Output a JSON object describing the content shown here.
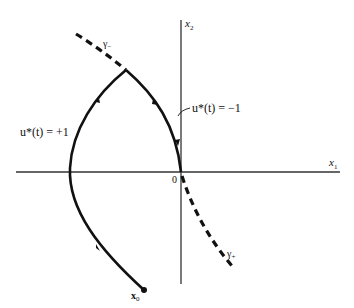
{
  "figure": {
    "type": "phase-plane trajectory diagram",
    "axes": {
      "x_label": "x",
      "x_sub": "1",
      "y_label": "x",
      "y_sub": "2",
      "origin_label": "0"
    },
    "curves": {
      "gamma_minus": {
        "label": "γ",
        "sub": "−",
        "style": "dashed"
      },
      "gamma_plus": {
        "label": "γ",
        "sub": "+",
        "style": "dashed"
      },
      "plus_arc": {
        "label": "u*(t) = +1",
        "style": "solid"
      },
      "minus_arc": {
        "label": "u*(t) = −1",
        "style": "solid"
      }
    },
    "start_point": {
      "label": "x",
      "sub": "0"
    },
    "colors": {
      "ink": "#111111",
      "axis": "#333333",
      "background": "#ffffff"
    }
  }
}
